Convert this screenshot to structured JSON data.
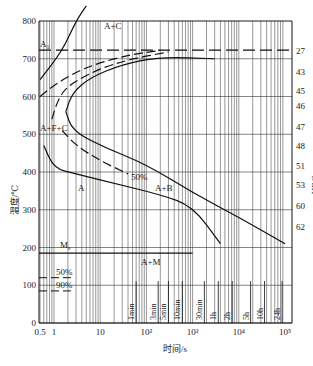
{
  "chart_data": {
    "type": "line",
    "title": "",
    "subtitle": "TTT (isothermal transformation) diagram with hardness scale",
    "xlabel": "时间/s",
    "ylabel": "温度/℃",
    "y2label": "HRC",
    "xscale": "log",
    "xlim": [
      0.5,
      100000
    ],
    "ylim": [
      0,
      800
    ],
    "grid": true,
    "legend_position": "none",
    "x_ticks": [
      {
        "value": 0.5,
        "label": "0.5"
      },
      {
        "value": 1,
        "label": "1"
      },
      {
        "value": 10,
        "label": "10"
      },
      {
        "value": 100,
        "label": "10²"
      },
      {
        "value": 1000,
        "label": "10³"
      },
      {
        "value": 10000,
        "label": "10⁴"
      },
      {
        "value": 100000,
        "label": "10⁵"
      }
    ],
    "y_ticks": [
      0,
      100,
      200,
      300,
      400,
      500,
      600,
      700,
      800
    ],
    "hrc_ticks": [
      {
        "temp": 720,
        "label": "27"
      },
      {
        "temp": 665,
        "label": "43"
      },
      {
        "temp": 615,
        "label": "45"
      },
      {
        "temp": 575,
        "label": "46"
      },
      {
        "temp": 520,
        "label": "47"
      },
      {
        "temp": 470,
        "label": "48"
      },
      {
        "temp": 415,
        "label": "51"
      },
      {
        "temp": 365,
        "label": "53"
      },
      {
        "temp": 310,
        "label": "60"
      },
      {
        "temp": 255,
        "label": "62"
      }
    ],
    "time_markers": [
      {
        "label": "1min",
        "seconds": 60
      },
      {
        "label": "3min",
        "seconds": 180
      },
      {
        "label": "5min",
        "seconds": 300
      },
      {
        "label": "10min",
        "seconds": 600
      },
      {
        "label": "30min",
        "seconds": 1800
      },
      {
        "label": "1h",
        "seconds": 3600
      },
      {
        "label": "2h",
        "seconds": 7200
      },
      {
        "label": "5h",
        "seconds": 18000
      },
      {
        "label": "10h",
        "seconds": 36000
      },
      {
        "label": "24h",
        "seconds": 86400
      }
    ],
    "reference_lines": [
      {
        "name": "A1",
        "label": "A₁",
        "temp": 723,
        "style": "dashed"
      },
      {
        "name": "Ms",
        "label": "Ms",
        "temp": 185,
        "style": "solid"
      },
      {
        "name": "M50",
        "label": "50%",
        "temp": 120,
        "style": "dashed"
      },
      {
        "name": "M90",
        "label": "90%",
        "temp": 85,
        "style": "dashed"
      }
    ],
    "series": [
      {
        "name": "start-dashed",
        "style": "dashed",
        "points": [
          [
            0.5,
            600
          ],
          [
            1,
            630
          ],
          [
            3,
            665
          ],
          [
            10,
            690
          ],
          [
            50,
            712
          ],
          [
            200,
            722
          ]
        ]
      },
      {
        "name": "50%-dashed",
        "style": "dashed",
        "points": [
          [
            0.9,
            540
          ],
          [
            1.2,
            590
          ],
          [
            2,
            630
          ],
          [
            10,
            675
          ],
          [
            50,
            700
          ],
          [
            300,
            718
          ]
        ]
      },
      {
        "name": "finish-upper",
        "style": "solid",
        "points": [
          [
            1.8,
            560
          ],
          [
            2.5,
            610
          ],
          [
            6,
            650
          ],
          [
            30,
            685
          ],
          [
            200,
            705
          ],
          [
            3000,
            700
          ]
        ]
      },
      {
        "name": "finish-lower",
        "style": "solid",
        "points": [
          [
            1.8,
            560
          ],
          [
            2.5,
            510
          ],
          [
            10,
            470
          ],
          [
            100,
            420
          ],
          [
            1000,
            345
          ],
          [
            10000,
            280
          ],
          [
            100000,
            210
          ]
        ]
      },
      {
        "name": "start-lower",
        "style": "solid",
        "points": [
          [
            0.6,
            470
          ],
          [
            1,
            410
          ],
          [
            3,
            395
          ],
          [
            20,
            370
          ],
          [
            200,
            340
          ],
          [
            1000,
            310
          ],
          [
            4000,
            210
          ]
        ]
      },
      {
        "name": "50%-lower",
        "style": "dashed",
        "points": [
          [
            1.5,
            510
          ],
          [
            3,
            470
          ],
          [
            10,
            430
          ],
          [
            40,
            395
          ]
        ]
      },
      {
        "name": "A1-intersect",
        "style": "solid",
        "points": [
          [
            0.5,
            645
          ],
          [
            1.5,
            720
          ],
          [
            3,
            800
          ],
          [
            5,
            840
          ]
        ]
      }
    ],
    "annotations": [
      {
        "text": "A₁",
        "x": 0.6,
        "y": 730
      },
      {
        "text": "A+C",
        "x": 45,
        "y": 765
      },
      {
        "text": "A+F+C",
        "x": 0.7,
        "y": 510
      },
      {
        "text": "50%",
        "x": 70,
        "y": 380
      },
      {
        "text": "A",
        "x": 5,
        "y": 350
      },
      {
        "text": "A+B",
        "x": 300,
        "y": 350
      },
      {
        "text": "Ms",
        "x": 5,
        "y": 200
      },
      {
        "text": "A+M",
        "x": 60,
        "y": 160
      },
      {
        "text": "50%",
        "x": 3,
        "y": 130
      },
      {
        "text": "90%",
        "x": 3,
        "y": 95
      }
    ]
  },
  "labels": {
    "xlabel": "时间/s",
    "ylabel": "温度/℃",
    "y2label": "HRC",
    "A1": "A",
    "A1_sub": "1",
    "AC": "A+C",
    "AFC": "A+F+C",
    "pct50": "50%",
    "A": "A",
    "AB": "A+B",
    "Ms": "M",
    "Ms_sub": "s",
    "AM": "A+M",
    "m50": "50%",
    "m90": "90%"
  }
}
